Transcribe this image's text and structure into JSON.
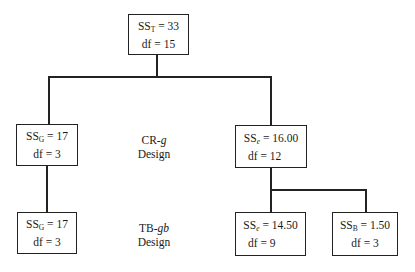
{
  "diagram": {
    "root": {
      "ss_symbol": "SS",
      "ss_subscript": "T",
      "ss_value": "33",
      "df_label": "df",
      "df_value": "15"
    },
    "crg_design": {
      "label_prefix": "CR-",
      "label_italic": "g",
      "label_line2": "Design",
      "groups_box": {
        "ss_symbol": "SS",
        "ss_subscript": "G",
        "ss_value": "17",
        "df_label": "df",
        "df_value": "3"
      },
      "error_box": {
        "ss_symbol": "SS",
        "ss_subscript": "e",
        "ss_value": "16.00",
        "df_label": "df",
        "df_value": "12"
      }
    },
    "tbgb_design": {
      "label_prefix": "TB-",
      "label_italic": "gb",
      "label_line2": "Design",
      "groups_box": {
        "ss_symbol": "SS",
        "ss_subscript": "G",
        "ss_value": "17",
        "df_label": "df",
        "df_value": "3"
      },
      "error_box": {
        "ss_symbol": "SS",
        "ss_subscript": "e",
        "ss_value": "14.50",
        "df_label": "df",
        "df_value": "9"
      },
      "blocks_box": {
        "ss_symbol": "SS",
        "ss_subscript": "B",
        "ss_value": "1.50",
        "df_label": "df",
        "df_value": "3"
      }
    },
    "equals": "="
  }
}
